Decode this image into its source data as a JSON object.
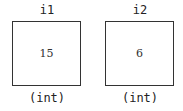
{
  "variables": [
    {
      "name": "i1",
      "value": "15",
      "type": "(int)"
    },
    {
      "name": "i2",
      "value": "6",
      "type": "(int)"
    }
  ]
}
